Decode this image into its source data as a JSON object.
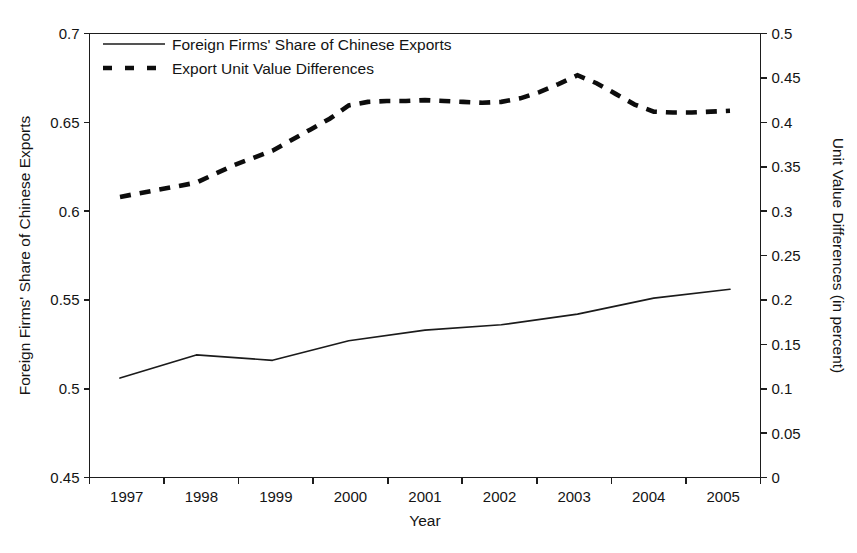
{
  "chart_data": {
    "type": "line",
    "title": "",
    "xlabel": "Year",
    "ylabel": "Foreign Firms' Share of Chinese Exports",
    "y2label": "Unit Value Differences (in percent)",
    "grid": false,
    "legend_position": "top-left",
    "x": [
      1997,
      1998,
      1999,
      2000,
      2001,
      2002,
      2003,
      2004,
      2005
    ],
    "xlim": [
      1996.6,
      2005.4
    ],
    "xtick_labels": [
      "1997",
      "1998",
      "1999",
      "2000",
      "2001",
      "2002",
      "2003",
      "2004",
      "2005"
    ],
    "ylim": [
      0.45,
      0.7
    ],
    "ytick_labels": [
      "0.45",
      "0.5",
      "0.55",
      "0.6",
      "0.65",
      "0.7"
    ],
    "ytick_values": [
      0.45,
      0.5,
      0.55,
      0.6,
      0.65,
      0.7
    ],
    "y2lim": [
      0,
      0.5
    ],
    "y2tick_labels": [
      "0",
      "0.05",
      "0.1",
      "0.15",
      "0.2",
      "0.25",
      "0.3",
      "0.35",
      "0.4",
      "0.45",
      "0.5"
    ],
    "y2tick_values": [
      0,
      0.05,
      0.1,
      0.15,
      0.2,
      0.25,
      0.3,
      0.35,
      0.4,
      0.45,
      0.5
    ],
    "series": [
      {
        "name": "Foreign Firms' Share of Chinese Exports",
        "axis": "left",
        "style": "solid",
        "color": "#1b1b1b",
        "x": [
          1997,
          1998,
          1999,
          2000,
          2001,
          2002,
          2003,
          2004,
          2005
        ],
        "values": [
          0.506,
          0.519,
          0.516,
          0.527,
          0.533,
          0.536,
          0.542,
          0.551,
          0.556
        ]
      },
      {
        "name": "Export Unit Value Differences",
        "axis": "right",
        "style": "dashed",
        "color": "#0d0d0d",
        "x": [
          1997.0,
          1997.25,
          1997.5,
          1997.75,
          1998.0,
          1998.25,
          1998.5,
          1998.75,
          1999.0,
          1999.25,
          1999.5,
          1999.75,
          2000.0,
          2000.25,
          2000.5,
          2000.75,
          2001.0,
          2001.25,
          2001.5,
          2001.75,
          2002.0,
          2002.25,
          2002.5,
          2002.75,
          2003.0,
          2003.25,
          2003.5,
          2003.75,
          2004.0,
          2004.25,
          2004.5,
          2004.75,
          2005.0
        ],
        "values": [
          0.316,
          0.32,
          0.324,
          0.328,
          0.332,
          0.342,
          0.352,
          0.36,
          0.368,
          0.38,
          0.392,
          0.404,
          0.419,
          0.423,
          0.424,
          0.424,
          0.425,
          0.424,
          0.423,
          0.422,
          0.423,
          0.427,
          0.434,
          0.443,
          0.453,
          0.444,
          0.432,
          0.42,
          0.412,
          0.411,
          0.411,
          0.412,
          0.413
        ]
      }
    ],
    "legend": [
      {
        "label": "Foreign Firms' Share of Chinese Exports",
        "style": "solid"
      },
      {
        "label": "Export Unit Value Differences",
        "style": "dashed"
      }
    ]
  }
}
